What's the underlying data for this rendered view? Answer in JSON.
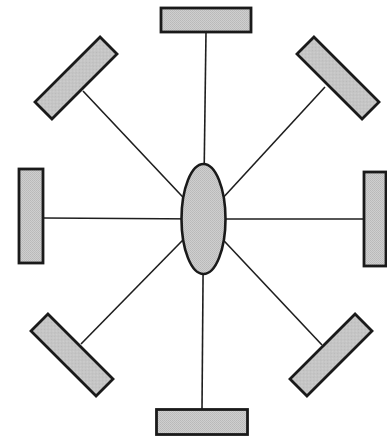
{
  "diagram": {
    "type": "radial hub-and-spoke",
    "colors": {
      "background": "#ffffff",
      "stroke": "#1a1a1a",
      "fill": "#c8c8c8"
    },
    "hub": {
      "shape": "ellipse",
      "cx": 203.5,
      "cy": 219,
      "rx": 22,
      "ry": 55
    },
    "blocks": [
      {
        "id": "top",
        "cx": 206,
        "cy": 20,
        "w": 90,
        "h": 24,
        "angle": 0,
        "stem": [
          206,
          32
        ]
      },
      {
        "id": "top-right",
        "cx": 338,
        "cy": 78,
        "w": 92,
        "h": 24,
        "angle": 45,
        "stem": [
          325,
          87
        ]
      },
      {
        "id": "right",
        "cx": 375,
        "cy": 219,
        "w": 22,
        "h": 94,
        "angle": 0,
        "stem": [
          363,
          219
        ]
      },
      {
        "id": "bottom-right",
        "cx": 331,
        "cy": 355,
        "w": 92,
        "h": 24,
        "angle": -45,
        "stem": [
          322,
          345
        ]
      },
      {
        "id": "bottom",
        "cx": 202,
        "cy": 422,
        "w": 91,
        "h": 25,
        "angle": 0,
        "stem": [
          202,
          409
        ]
      },
      {
        "id": "bottom-left",
        "cx": 72,
        "cy": 355,
        "w": 92,
        "h": 24,
        "angle": 45,
        "stem": [
          81,
          344
        ]
      },
      {
        "id": "left",
        "cx": 31,
        "cy": 216,
        "w": 24,
        "h": 94,
        "angle": 0,
        "stem": [
          44,
          218
        ]
      },
      {
        "id": "top-left",
        "cx": 76,
        "cy": 78,
        "w": 92,
        "h": 24,
        "angle": -45,
        "stem": [
          83,
          91
        ]
      }
    ]
  }
}
